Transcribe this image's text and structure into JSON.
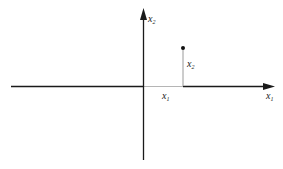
{
  "diagram": {
    "type": "vector-in-2d-plane",
    "axes": {
      "horizontal": {
        "label": "x",
        "subscript": "1"
      },
      "vertical": {
        "label": "x",
        "subscript": "2"
      }
    },
    "point": {
      "component_1_label": {
        "label": "x",
        "subscript": "1"
      },
      "component_2_label": {
        "label": "x",
        "subscript": "2"
      }
    },
    "colors": {
      "axis": "#1a1a1a",
      "projection": "#9a9a9a",
      "point": "#111111"
    }
  }
}
